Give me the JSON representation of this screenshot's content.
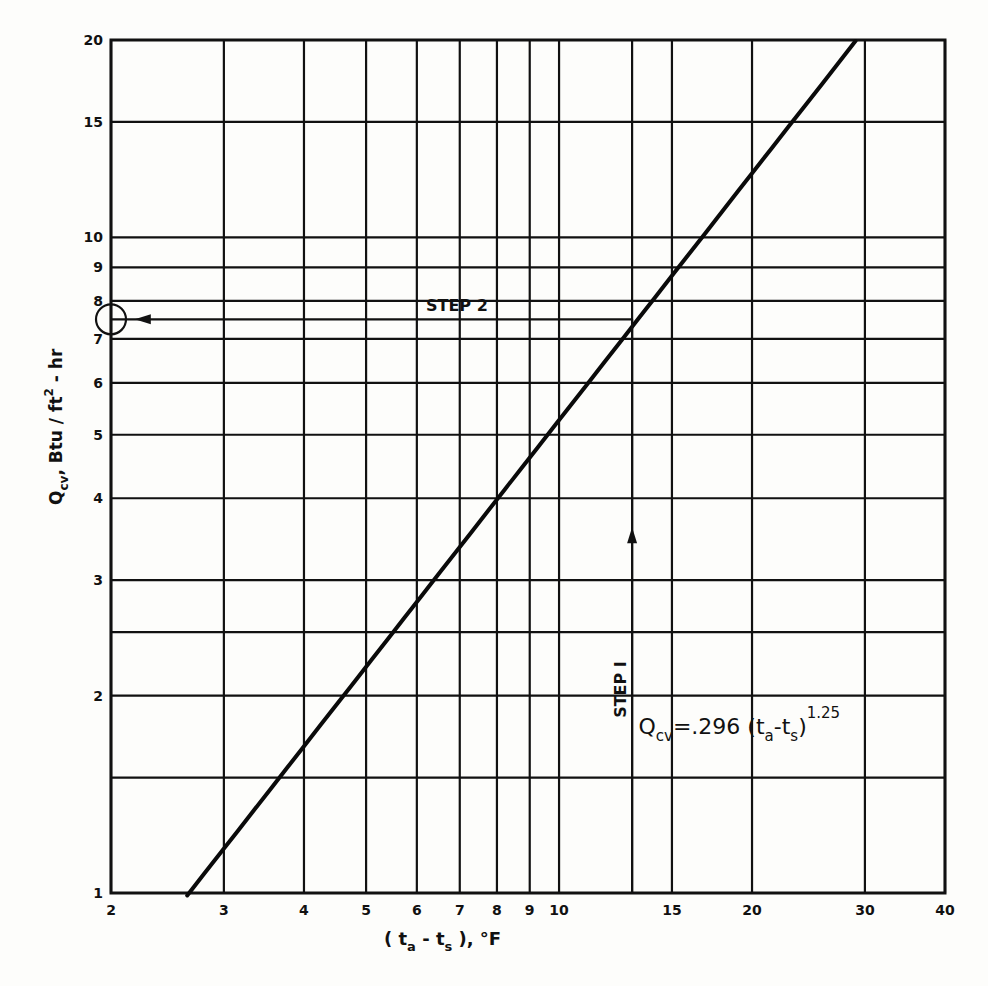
{
  "chart_data": {
    "type": "line",
    "title": "",
    "xlabel": "(t_a - t_s), °F",
    "ylabel": "Q_cv, Btu/ft²-hr",
    "xscale": "log",
    "yscale": "log",
    "xlim": [
      2,
      40
    ],
    "ylim": [
      1,
      20
    ],
    "grid": true,
    "legend": null,
    "x_ticks": [
      2,
      3,
      4,
      5,
      6,
      7,
      8,
      9,
      10,
      15,
      20,
      30,
      40
    ],
    "x_tick_labels": [
      "2",
      "3",
      "4",
      "5",
      "6",
      "7",
      "8",
      "9",
      "10",
      "15",
      "20",
      "30",
      "40"
    ],
    "x_gridlines": [
      2,
      3,
      4,
      5,
      6,
      7,
      8,
      9,
      10,
      13,
      15,
      20,
      30,
      40
    ],
    "y_ticks": [
      1,
      2,
      3,
      4,
      5,
      6,
      7,
      8,
      9,
      10,
      15,
      20
    ],
    "y_tick_labels": [
      "1",
      "2",
      "3",
      "4",
      "5",
      "6",
      "7",
      "8",
      "9",
      "10",
      "15",
      "20"
    ],
    "y_gridlines": [
      1,
      1.5,
      2,
      2.5,
      3,
      4,
      5,
      6,
      7,
      7.5,
      8,
      9,
      10,
      15,
      20
    ],
    "series": [
      {
        "name": "Q_cv = .296 (t_a - t_s)^1.25",
        "equation": {
          "coefficient": 0.296,
          "exponent": 1.25
        },
        "x": [
          2.63,
          3,
          4,
          5,
          6,
          7,
          8,
          9,
          10,
          13,
          15,
          20,
          29
        ],
        "y": [
          1.0,
          1.17,
          1.67,
          2.21,
          2.78,
          3.38,
          3.98,
          4.61,
          5.26,
          7.5,
          8.97,
          12.5,
          20.0
        ]
      }
    ],
    "annotations": [
      {
        "text": "STEP 1",
        "type": "vertical-arrow",
        "x": 13,
        "from_y": 1,
        "to_y": 7.5,
        "arrow_at_y": 3.5,
        "direction": "up"
      },
      {
        "text": "STEP 2",
        "type": "horizontal-arrow",
        "y": 7.5,
        "from_x": 13,
        "to_x": 2,
        "arrow_at_x": 2.25,
        "direction": "left"
      },
      {
        "text": "circle",
        "type": "result-marker",
        "x": 2,
        "y": 7.5
      },
      {
        "text": "Q_cv = .296 (t_a - t_s)^1.25",
        "type": "equation-label",
        "x": 13.3,
        "y": 1.75
      }
    ]
  },
  "labels": {
    "ylabel_main": "Q",
    "ylabel_sub": "cv",
    "ylabel_rest": ", Btu / ft",
    "ylabel_sup": "2",
    "ylabel_end": " - hr",
    "xlabel_open": "( t",
    "xlabel_sub1": "a",
    "xlabel_mid": " - t",
    "xlabel_sub2": "s",
    "xlabel_close": " ),   °F",
    "step1": "STEP  I",
    "step2": "STEP  2",
    "eq_q": "Q",
    "eq_sub": "cv",
    "eq_mid": "=.296 (t",
    "eq_sub_a": "a",
    "eq_minus": "-t",
    "eq_sub_s": "s",
    "eq_close": ")",
    "eq_exp": "1.25"
  }
}
